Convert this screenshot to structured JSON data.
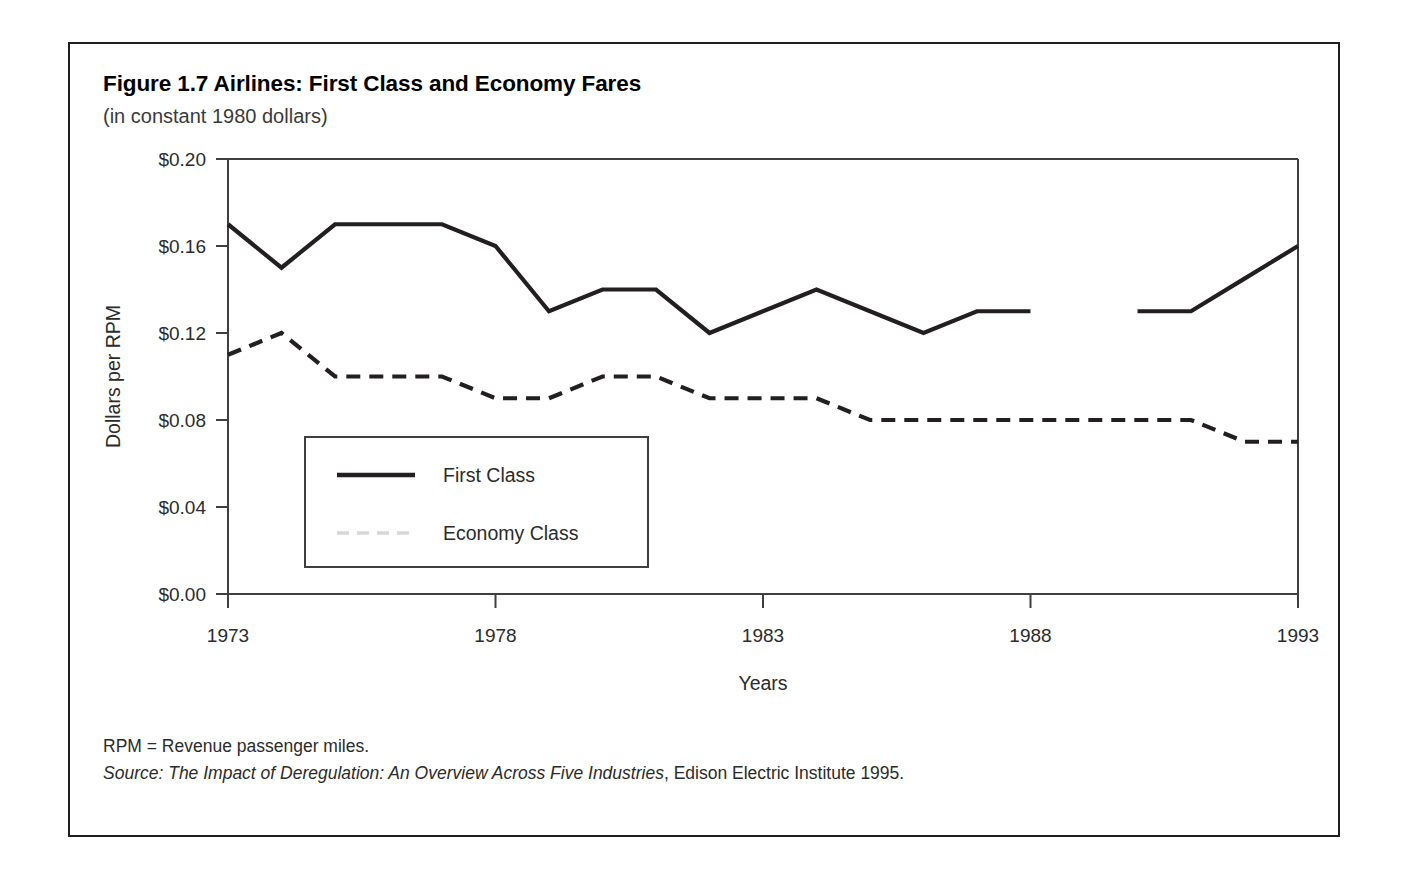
{
  "figure": {
    "title": "Figure 1.7 Airlines: First Class and Economy Fares",
    "subtitle": "(in constant 1980 dollars)",
    "footnote_rpm": "RPM = Revenue passenger miles.",
    "footnote_source_label": "Source: ",
    "footnote_source_title": "The Impact of Deregulation: An Overview Across Five Industries",
    "footnote_source_rest": ", Edison Electric Institute 1995."
  },
  "colors": {
    "line": "#231f20",
    "axis": "#3f3f3f",
    "border": "#231f20",
    "text": "#2b2b2b",
    "background": "#ffffff",
    "legend_economy_swatch": "#d8d8d8"
  },
  "axis": {
    "y_ticks": [
      "$0.00",
      "$0.04",
      "$0.08",
      "$0.12",
      "$0.16",
      "$0.20"
    ],
    "y_tick_values": [
      0.0,
      0.04,
      0.08,
      0.12,
      0.16,
      0.2
    ],
    "x_ticks": [
      "1973",
      "1978",
      "1983",
      "1988",
      "1993"
    ],
    "x_tick_values": [
      1973,
      1978,
      1983,
      1988,
      1993
    ]
  },
  "legend": {
    "items": [
      {
        "label": "First Class",
        "style": "solid"
      },
      {
        "label": "Economy Class",
        "style": "dashed"
      }
    ]
  },
  "chart_data": {
    "type": "line",
    "title": "Figure 1.7 Airlines: First Class and Economy Fares",
    "subtitle": "(in constant 1980 dollars)",
    "xlabel": "Years",
    "ylabel": "Dollars per RPM",
    "xlim": [
      1973,
      1993
    ],
    "ylim": [
      0.0,
      0.2
    ],
    "grid": false,
    "legend_position": "inside-lower-left",
    "x": [
      1973,
      1974,
      1975,
      1976,
      1977,
      1978,
      1979,
      1980,
      1981,
      1982,
      1983,
      1984,
      1985,
      1986,
      1987,
      1988,
      1989,
      1990,
      1991,
      1992,
      1993
    ],
    "series": [
      {
        "name": "First Class",
        "style": "solid",
        "gaps": [
          [
            1988,
            1989
          ]
        ],
        "values": [
          0.17,
          0.15,
          0.17,
          0.17,
          0.17,
          0.16,
          0.13,
          0.14,
          0.14,
          0.12,
          0.13,
          0.14,
          0.13,
          0.12,
          0.13,
          0.13,
          null,
          0.13,
          0.13,
          0.145,
          0.16
        ]
      },
      {
        "name": "Economy Class",
        "style": "dashed",
        "values": [
          0.11,
          0.12,
          0.1,
          0.1,
          0.1,
          0.09,
          0.09,
          0.1,
          0.1,
          0.09,
          0.09,
          0.09,
          0.08,
          0.08,
          0.08,
          0.08,
          0.08,
          0.08,
          0.08,
          0.07,
          0.07
        ]
      }
    ]
  }
}
